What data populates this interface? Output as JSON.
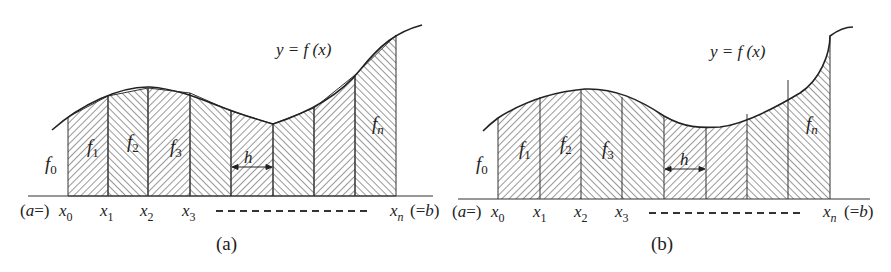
{
  "figure": {
    "panels": [
      {
        "id": "a",
        "caption": "(a)",
        "curve_label": "y = f (x)",
        "ordinate_labels": [
          "f0",
          "f1",
          "f2",
          "f3",
          "fn"
        ],
        "width_label": "h",
        "axis_labels": {
          "start": "(a =) x0",
          "points": [
            "x1",
            "x2",
            "x3"
          ],
          "ellipsis": "- - - - - - - - - - - - -",
          "end": "xn (=b)"
        }
      },
      {
        "id": "b",
        "caption": "(b)",
        "curve_label": "y = f (x)",
        "ordinate_labels": [
          "f0",
          "f1",
          "f2",
          "f3",
          "fn"
        ],
        "width_label": "h",
        "axis_labels": {
          "start": "(a =) x0",
          "points": [
            "x1",
            "x2",
            "x3"
          ],
          "ellipsis": "- - - - - - - - - - - - -",
          "end": "xn (=b)"
        }
      }
    ],
    "text": {
      "a_eq": "(a =)",
      "x": "x",
      "sub0": "0",
      "sub1": "1",
      "sub2": "2",
      "sub3": "3",
      "subn": "n",
      "eq_b": "(=b)",
      "f": "f",
      "h": "h",
      "y_eq": "y = f (x)",
      "cap_a": "(a)",
      "cap_b": "(b)"
    },
    "colors": {
      "ink": "#222222",
      "background": "#ffffff"
    }
  }
}
